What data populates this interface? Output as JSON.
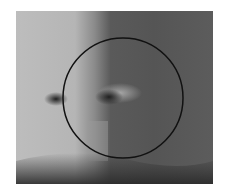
{
  "image": {
    "subject": "grayscale close-up of a nose with circular overlay",
    "overlay": {
      "shape": "circle",
      "color": "#111111"
    }
  }
}
